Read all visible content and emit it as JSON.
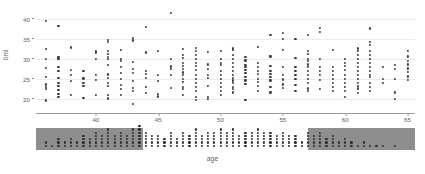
{
  "chart_data": {
    "type": "scatter",
    "title": "",
    "subtitle": "",
    "xlabel": "age",
    "ylabel": "bmi",
    "xlim": [
      35.2,
      65.6
    ],
    "ylim": [
      18.2,
      42.2
    ],
    "grid": true,
    "legend": null,
    "x_ticks": [
      40,
      45,
      50,
      55,
      60,
      65
    ],
    "y_ticks": [
      20,
      25,
      30,
      35,
      40
    ],
    "x_tick_labels": [
      "40",
      "45",
      "50",
      "55",
      "60",
      "65"
    ],
    "y_tick_labels": [
      "20",
      "25",
      "30",
      "35",
      "40"
    ],
    "marker": {
      "shape": "circle",
      "color": "#3d3d3d",
      "size": 2.2
    },
    "points": [
      {
        "x": 36,
        "y": [
          19.6,
          22.4,
          23.0,
          23.6,
          25.4,
          27.8,
          30.0,
          32.4,
          39.4
        ]
      },
      {
        "x": 37,
        "y": [
          20.5,
          21.3,
          22.3,
          23.2,
          24.0,
          25.3,
          27.0,
          28.0,
          30.0,
          30.2,
          30.5,
          38.3
        ]
      },
      {
        "x": 38,
        "y": [
          21.0,
          24.5,
          26.0,
          27.2,
          32.7,
          32.9
        ]
      },
      {
        "x": 39,
        "y": [
          20.3,
          23.2,
          24.0,
          25.1,
          27.0
        ]
      },
      {
        "x": 40,
        "y": [
          21.0,
          24.8,
          26.0,
          30.0,
          31.6,
          32.0
        ]
      },
      {
        "x": 41,
        "y": [
          20.1,
          21.0,
          23.2,
          24.0,
          25.2,
          26.1,
          28.5,
          30.0,
          30.5,
          31.2,
          32.0,
          34.3,
          34.8
        ]
      },
      {
        "x": 42,
        "y": [
          21.0,
          22.5,
          23.4,
          25.0,
          26.4,
          28.0,
          29.4,
          30.0,
          32.3
        ]
      },
      {
        "x": 43,
        "y": [
          18.8,
          22.0,
          22.8,
          24.4,
          26.5,
          27.4,
          29.2,
          34.6,
          35.3
        ]
      },
      {
        "x": 44,
        "y": [
          21.4,
          23.0,
          25.2,
          26.3,
          27.0,
          31.6,
          38.0
        ]
      },
      {
        "x": 45,
        "y": [
          20.6,
          21.2,
          24.5,
          26.0,
          32.0
        ]
      },
      {
        "x": 46,
        "y": [
          22.8,
          26.0,
          27.4,
          28.1,
          30.0,
          41.5
        ]
      },
      {
        "x": 47,
        "y": [
          21.0,
          22.4,
          23.0,
          24.3,
          25.0,
          26.0,
          26.6,
          27.4,
          28.2,
          29.0,
          30.2,
          31.0,
          32.4
        ]
      },
      {
        "x": 48,
        "y": [
          19.8,
          20.4,
          22.0,
          23.0,
          24.0,
          25.0,
          26.0,
          27.2,
          28.2,
          29.0,
          30.0,
          31.0,
          32.0,
          32.8
        ]
      },
      {
        "x": 49,
        "y": [
          20.0,
          20.4,
          23.2,
          25.2,
          26.0,
          27.4,
          28.6,
          31.8
        ]
      },
      {
        "x": 50,
        "y": [
          21.0,
          22.0,
          23.0,
          24.0,
          25.0,
          26.0,
          27.0,
          28.4,
          29.0,
          30.0,
          32.0
        ]
      },
      {
        "x": 51,
        "y": [
          21.6,
          22.4,
          23.0,
          24.0,
          24.6,
          25.2,
          26.0,
          27.0,
          28.0,
          29.0,
          30.0,
          31.0,
          32.2,
          32.6
        ]
      },
      {
        "x": 52,
        "y": [
          19.8,
          23.8,
          24.6,
          25.4,
          26.4,
          27.2,
          28.0,
          28.5,
          29.6,
          30.4
        ]
      },
      {
        "x": 53,
        "y": [
          22.0,
          23.2,
          24.2,
          25.0,
          26.2,
          27.0,
          28.0,
          29.0,
          33.0
        ]
      },
      {
        "x": 54,
        "y": [
          21.6,
          23.0,
          24.6,
          25.4,
          26.2,
          27.0,
          28.2,
          30.6,
          36.0
        ]
      },
      {
        "x": 55,
        "y": [
          22.8,
          23.6,
          24.8,
          25.0,
          26.0,
          28.0,
          32.2,
          35.0,
          36.5
        ]
      },
      {
        "x": 56,
        "y": [
          22.0,
          23.4,
          25.0,
          26.0,
          27.0,
          28.0,
          30.2,
          35.0
        ]
      },
      {
        "x": 57,
        "y": [
          22.0,
          22.6,
          24.0,
          25.0,
          26.0,
          27.0,
          28.0,
          28.6,
          29.4,
          30.0,
          31.2,
          32.0,
          36.0
        ]
      },
      {
        "x": 58,
        "y": [
          22.5,
          24.8,
          26.0,
          27.0,
          28.0,
          30.0,
          36.8,
          37.8
        ]
      },
      {
        "x": 59,
        "y": [
          22.0,
          23.0,
          24.0,
          25.0,
          26.0,
          27.0,
          28.0,
          32.2
        ]
      },
      {
        "x": 60,
        "y": [
          20.5,
          22.0,
          23.0,
          24.0,
          25.0,
          26.0,
          27.2,
          28.2,
          29.0,
          30.0
        ]
      },
      {
        "x": 61,
        "y": [
          21.4,
          22.6,
          23.2,
          24.0,
          25.0,
          26.0,
          27.0,
          28.0,
          29.0,
          30.0,
          31.0,
          32.0,
          32.6
        ]
      },
      {
        "x": 62,
        "y": [
          22.0,
          23.0,
          24.0,
          25.4,
          26.0,
          27.0,
          28.0,
          29.0,
          30.0,
          31.0,
          32.0,
          33.4,
          34.2,
          37.6
        ]
      },
      {
        "x": 63,
        "y": [
          24.0,
          25.0,
          28.0
        ]
      },
      {
        "x": 64,
        "y": [
          20.0,
          21.6,
          25.0,
          27.4,
          28.4
        ]
      },
      {
        "x": 65,
        "y": [
          24.8,
          25.6,
          26.8,
          27.6,
          28.6,
          29.4,
          30.6,
          32.0
        ]
      }
    ],
    "rug": {
      "description": "age distribution rug plot below main axes",
      "band_color": "#8e8e8e",
      "dot_color": "#2f2f2f",
      "bands": [
        {
          "from": 35.2,
          "to": 43.8
        },
        {
          "from": 57.0,
          "to": 65.6
        }
      ],
      "counts": [
        {
          "x": 36,
          "n": 2
        },
        {
          "x": 36.5,
          "n": 1
        },
        {
          "x": 37,
          "n": 3
        },
        {
          "x": 37.5,
          "n": 2
        },
        {
          "x": 38,
          "n": 3
        },
        {
          "x": 38.5,
          "n": 2
        },
        {
          "x": 39,
          "n": 4
        },
        {
          "x": 39.5,
          "n": 3
        },
        {
          "x": 40,
          "n": 5
        },
        {
          "x": 40.5,
          "n": 4
        },
        {
          "x": 41,
          "n": 6
        },
        {
          "x": 41.5,
          "n": 4
        },
        {
          "x": 42,
          "n": 5
        },
        {
          "x": 42.5,
          "n": 4
        },
        {
          "x": 43,
          "n": 6
        },
        {
          "x": 43.5,
          "n": 7
        },
        {
          "x": 44,
          "n": 5
        },
        {
          "x": 44.5,
          "n": 4
        },
        {
          "x": 45,
          "n": 4
        },
        {
          "x": 45.5,
          "n": 3
        },
        {
          "x": 46,
          "n": 5
        },
        {
          "x": 46.5,
          "n": 3
        },
        {
          "x": 47,
          "n": 5
        },
        {
          "x": 47.5,
          "n": 4
        },
        {
          "x": 48,
          "n": 6
        },
        {
          "x": 48.5,
          "n": 4
        },
        {
          "x": 49,
          "n": 5
        },
        {
          "x": 49.5,
          "n": 5
        },
        {
          "x": 50,
          "n": 6
        },
        {
          "x": 50.5,
          "n": 5
        },
        {
          "x": 51,
          "n": 6
        },
        {
          "x": 51.5,
          "n": 4
        },
        {
          "x": 52,
          "n": 5
        },
        {
          "x": 52.5,
          "n": 5
        },
        {
          "x": 53,
          "n": 6
        },
        {
          "x": 53.5,
          "n": 5
        },
        {
          "x": 54,
          "n": 5
        },
        {
          "x": 54.5,
          "n": 4
        },
        {
          "x": 55,
          "n": 5
        },
        {
          "x": 55.5,
          "n": 4
        },
        {
          "x": 56,
          "n": 4
        },
        {
          "x": 56.5,
          "n": 2
        },
        {
          "x": 57,
          "n": 5
        },
        {
          "x": 57.5,
          "n": 4
        },
        {
          "x": 58,
          "n": 5
        },
        {
          "x": 58.5,
          "n": 3
        },
        {
          "x": 59,
          "n": 4
        },
        {
          "x": 59.5,
          "n": 2
        },
        {
          "x": 60,
          "n": 3
        },
        {
          "x": 60.5,
          "n": 2
        },
        {
          "x": 61,
          "n": 1
        },
        {
          "x": 61.5,
          "n": 2
        },
        {
          "x": 62,
          "n": 1
        },
        {
          "x": 62.5,
          "n": 1
        },
        {
          "x": 63,
          "n": 1
        },
        {
          "x": 64,
          "n": 1
        }
      ]
    }
  },
  "axes": {
    "y_label": "bmi",
    "x_label": "age"
  }
}
